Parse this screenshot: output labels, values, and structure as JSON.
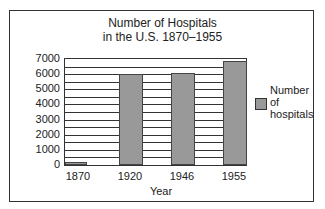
{
  "chart_data": {
    "type": "bar",
    "title_lines": [
      "Number of Hospitals",
      "in the U.S. 1870–1955"
    ],
    "categories": [
      "1870",
      "1920",
      "1946",
      "1955"
    ],
    "series": [
      {
        "name": "Number of hospitals",
        "values": [
          180,
          6000,
          6100,
          6850
        ],
        "color": "#999999"
      }
    ],
    "xlabel": "Year",
    "ylabel": "",
    "ylim": [
      0,
      7000
    ],
    "yticks": [
      "7000",
      "6000",
      "5000",
      "4000",
      "3000",
      "2000",
      "1000",
      "0"
    ],
    "grid": true,
    "grid_step": 500,
    "legend_position": "right",
    "legend_lines": [
      "Number",
      "of",
      "hospitals"
    ]
  }
}
